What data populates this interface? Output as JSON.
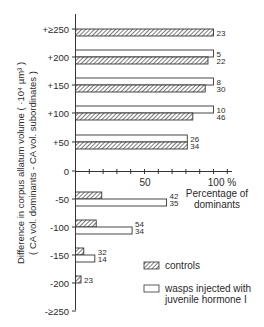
{
  "chart_data": {
    "type": "bar",
    "orientation": "horizontal",
    "title": "",
    "ylabel_line1": "Difference in corpus allatum volume  ( ·10⁴ µm³ )",
    "ylabel_line2": "( CA vol. dominants - CA vol. subordinates )",
    "xlabel_line1": "Percentage of",
    "xlabel_line2": "dominants",
    "x_ticks": [
      "50",
      "100 %"
    ],
    "x_tick_values": [
      50,
      100
    ],
    "xlim": [
      0,
      100
    ],
    "x_minor_step": 10,
    "categories": [
      "+≥250",
      "+200",
      "+150",
      "+100",
      "+50",
      "-50",
      "-100",
      "-150",
      "-200",
      "-≥250"
    ],
    "y_tick_labels": [
      "+≥250",
      "+200",
      "+150",
      "+100",
      "+50",
      "0",
      "-50",
      "-100",
      "-150",
      "-200",
      "-≥250"
    ],
    "series": [
      {
        "name": "controls",
        "pattern": "hatched",
        "values": [
          100,
          96,
          94,
          85,
          81,
          19,
          15,
          6,
          4,
          0
        ],
        "n": [
          "23",
          "22",
          "30",
          "46",
          "34",
          "42",
          "54",
          "32",
          "23",
          ""
        ]
      },
      {
        "name": "wasps injected with juvenile hormone I",
        "pattern": "open",
        "values": [
          0,
          100,
          100,
          100,
          81,
          66,
          41,
          14,
          0,
          0
        ],
        "n": [
          "",
          "5",
          "8",
          "10",
          "26",
          "35",
          "34",
          "14",
          "",
          ""
        ]
      }
    ],
    "legend": {
      "position": "lower right",
      "items": [
        "controls",
        "wasps injected with juvenile hormone I"
      ],
      "item2_line1": "wasps injected with",
      "item2_line2": "juvenile hormone I"
    },
    "grid": false
  }
}
